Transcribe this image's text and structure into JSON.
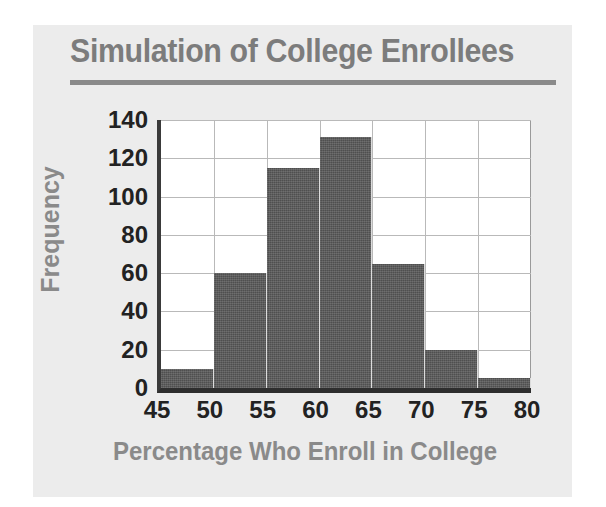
{
  "chart_data": {
    "type": "bar",
    "title": "Simulation of College Enrollees",
    "xlabel": "Percentage Who Enroll in College",
    "ylabel": "Frequency",
    "bin_edges": [
      45,
      50,
      55,
      60,
      65,
      70,
      75,
      80
    ],
    "categories": [
      "45-50",
      "50-55",
      "55-60",
      "60-65",
      "65-70",
      "70-75",
      "75-80"
    ],
    "values": [
      10,
      60,
      115,
      131,
      65,
      20,
      5
    ],
    "xlim": [
      45,
      80
    ],
    "ylim": [
      0,
      140
    ],
    "xticks": [
      "45",
      "50",
      "55",
      "60",
      "65",
      "70",
      "75",
      "80"
    ],
    "yticks": [
      "0",
      "20",
      "40",
      "60",
      "80",
      "100",
      "120",
      "140"
    ],
    "grid": true,
    "legend": "none",
    "bar_color": "#4f4f4f",
    "plot_background": "#ffffff",
    "card_background": "#ececec",
    "title_color": "#7c7c7c",
    "axis_label_color": "#8a8a8a",
    "tick_color": "#222222",
    "gridline_color": "#b9b9b9"
  }
}
